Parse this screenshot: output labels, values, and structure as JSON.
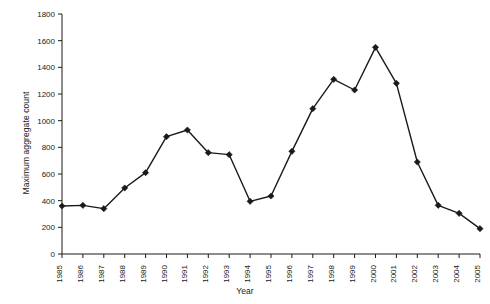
{
  "chart_data": {
    "type": "line",
    "title": "",
    "subtitle": "",
    "xlabel": "Year",
    "ylabel": "Maximum aggregate count",
    "categories": [
      "1985",
      "1986",
      "1987",
      "1988",
      "1989",
      "1990",
      "1991",
      "1992",
      "1993",
      "1994",
      "1995",
      "1996",
      "1997",
      "1998",
      "1999",
      "2000",
      "2001",
      "2002",
      "2003",
      "2004",
      "2005"
    ],
    "values": [
      360,
      365,
      340,
      495,
      610,
      880,
      930,
      760,
      745,
      395,
      435,
      770,
      1090,
      1310,
      1230,
      1550,
      1280,
      690,
      365,
      305,
      190
    ],
    "ylim": [
      0,
      1800
    ],
    "yticks": [
      0,
      200,
      400,
      600,
      800,
      1000,
      1200,
      1400,
      1600,
      1800
    ],
    "ytick_labels": [
      "0",
      "200",
      "400",
      "600",
      "800",
      "1000",
      "1200",
      "1400",
      "1600",
      "1800"
    ],
    "grid": false,
    "legend": "none",
    "marker": "diamond",
    "line_color": "#1a1a1a",
    "marker_color": "#1a1a1a",
    "axis_color": "#1a1a1a",
    "background": "#ffffff"
  }
}
